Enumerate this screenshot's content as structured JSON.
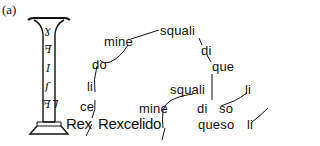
{
  "panel_label": "(a)",
  "column": {
    "glyphs": [
      "ɣ",
      "ꟻ",
      "I",
      "ſ",
      "ꟻꓶ"
    ]
  },
  "words": {
    "squali_top": "squali",
    "di_top": "di",
    "que": "que",
    "mine_top": "mine",
    "do": "do",
    "li_left": "li",
    "ce": "ce",
    "squali_mid": "squali",
    "li_right_top": "li",
    "mine_mid": "mine",
    "di_mid": "di",
    "so": "so",
    "rex": "Rex",
    "rexcelido": "Rexcelido",
    "queso": "queso",
    "li_right_bottom": "li"
  }
}
